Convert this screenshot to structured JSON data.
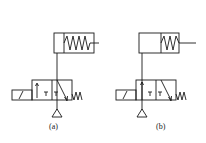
{
  "diagram": {
    "type": "pneumatic-circuit",
    "colors": {
      "line": "#1a1a1a",
      "background": "#ffffff"
    },
    "panels": [
      {
        "id": "a",
        "label": "(a)",
        "cylinder": "single-acting spring-return, spring side full",
        "valve": "3/2 solenoid valve, spring return"
      },
      {
        "id": "b",
        "label": "(b)",
        "cylinder": "single-acting spring-return, spring side short",
        "valve": "3/2 solenoid valve, spring return"
      }
    ]
  }
}
